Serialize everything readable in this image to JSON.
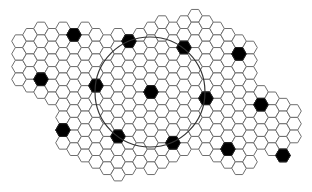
{
  "diagram": {
    "type": "hexagonal-grid",
    "orientation": "flat-top",
    "colors": {
      "background": "#ffffff",
      "cell_fill": "#ffffff",
      "cell_stroke": "#6e6e6e",
      "highlight_fill": "#000000",
      "circle_stroke": "#333333"
    },
    "grid": {
      "origin": [
        151,
        92
      ],
      "column_spacing": 11,
      "row_spacing": 12.7,
      "hex_radius": 7.3,
      "columns": [
        {
          "i": -12,
          "j": [
            -4,
            -1
          ]
        },
        {
          "i": -11,
          "j": [
            -5,
            -1
          ]
        },
        {
          "i": -10,
          "j": [
            -5,
            0
          ]
        },
        {
          "i": -9,
          "j": [
            -5,
            0
          ]
        },
        {
          "i": -8,
          "j": [
            -5,
            4
          ]
        },
        {
          "i": -7,
          "j": [
            -5,
            4
          ]
        },
        {
          "i": -6,
          "j": [
            -5,
            5
          ]
        },
        {
          "i": -5,
          "j": [
            -5,
            5
          ]
        },
        {
          "i": -4,
          "j": [
            -4,
            6
          ]
        },
        {
          "i": -3,
          "j": [
            -5,
            6
          ]
        },
        {
          "i": -2,
          "j": [
            -4,
            6
          ]
        },
        {
          "i": -1,
          "j": [
            -5,
            5
          ]
        },
        {
          "i": 0,
          "j": [
            -5,
            6
          ]
        },
        {
          "i": 1,
          "j": [
            -6,
            5
          ]
        },
        {
          "i": 2,
          "j": [
            -5,
            5
          ]
        },
        {
          "i": 3,
          "j": [
            -6,
            4
          ]
        },
        {
          "i": 4,
          "j": [
            -6,
            4
          ]
        },
        {
          "i": 5,
          "j": [
            -6,
            4
          ]
        },
        {
          "i": 6,
          "j": [
            -5,
            5
          ]
        },
        {
          "i": 7,
          "j": [
            -5,
            5
          ]
        },
        {
          "i": 8,
          "j": [
            -4,
            6
          ]
        },
        {
          "i": 9,
          "j": [
            -4,
            5
          ]
        },
        {
          "i": 10,
          "j": [
            0,
            4
          ]
        },
        {
          "i": 11,
          "j": [
            0,
            4
          ]
        },
        {
          "i": 12,
          "j": [
            1,
            5
          ]
        },
        {
          "i": 13,
          "j": [
            1,
            3
          ]
        }
      ]
    },
    "black_cells": [
      {
        "i": -7,
        "j": -5
      },
      {
        "i": -2,
        "j": -4
      },
      {
        "i": -10,
        "j": -1
      },
      {
        "i": -5,
        "j": -1
      },
      {
        "i": 3,
        "j": -4
      },
      {
        "i": 8,
        "j": -3
      },
      {
        "i": 0,
        "j": 0
      },
      {
        "i": 5,
        "j": 0
      },
      {
        "i": -8,
        "j": 3
      },
      {
        "i": -3,
        "j": 3
      },
      {
        "i": 10,
        "j": 1
      },
      {
        "i": 2,
        "j": 4
      },
      {
        "i": 7,
        "j": 4
      },
      {
        "i": 12,
        "j": 5
      }
    ],
    "circle": {
      "cx": 150,
      "cy": 92,
      "r": 55
    }
  }
}
